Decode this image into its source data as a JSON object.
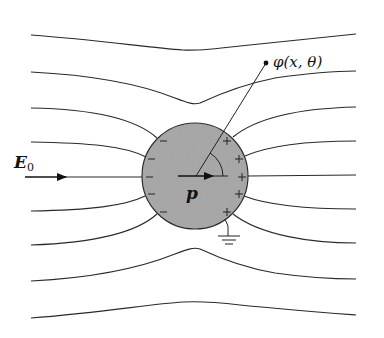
{
  "diagram": {
    "type": "physics-diagram",
    "labels": {
      "field": "E",
      "field_subscript": "0",
      "dipole": "p",
      "potential": "φ(x, θ)"
    },
    "sphere": {
      "center": [
        195,
        176
      ],
      "radius": 53,
      "fill": "#a9a9a9",
      "stroke": "#2a2a2a"
    },
    "charges": {
      "left_sign": "−",
      "right_sign": "+",
      "left_count": 5,
      "right_count": 5
    },
    "field_lines_left_edge_y": [
      35,
      72,
      108,
      142,
      177,
      211,
      245,
      281,
      318
    ],
    "field_lines_right_edge_y": [
      34,
      71,
      107,
      141,
      175,
      209,
      243,
      279,
      315
    ],
    "ground_symbol": true,
    "colors": {
      "line": "#2a2a2a",
      "sphere_fill": "#a9a9a9",
      "background": "#ffffff"
    }
  }
}
